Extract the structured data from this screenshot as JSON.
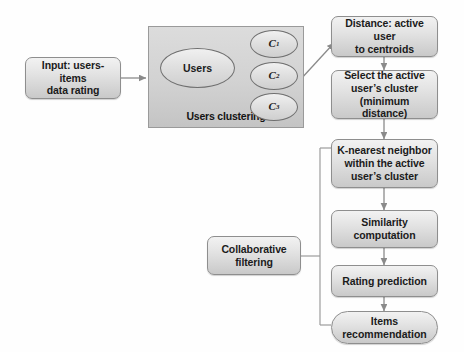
{
  "diagram": {
    "background_color": "#fefefe",
    "node_fill_light": "#f2f2f2",
    "node_fill_dark": "#c9c9c9",
    "node_border_color": "#8e8e8e",
    "group_fill": "#d4d4d4",
    "connector_color": "#8a8a8a"
  },
  "nodes": {
    "input": {
      "label_line1": "Input: users-items",
      "label_line2": "data rating",
      "shape": "rounded-rectangle"
    },
    "users": {
      "label": "Users",
      "shape": "ellipse"
    },
    "cluster1": {
      "label": "C",
      "subscript": "1",
      "shape": "ellipse"
    },
    "cluster2": {
      "label": "C",
      "subscript": "2",
      "shape": "ellipse"
    },
    "cluster3": {
      "label": "C",
      "subscript": "3",
      "shape": "ellipse"
    },
    "clustering_group": {
      "label": "Users clustering",
      "shape": "rectangle"
    },
    "distance": {
      "label_line1": "Distance: active user",
      "label_line2": "to centroids",
      "shape": "rounded-rectangle"
    },
    "select_cluster": {
      "label_line1": "Select the active",
      "label_line2": "user’s cluster",
      "label_line3": "(minimum distance)",
      "shape": "rounded-rectangle"
    },
    "knn": {
      "label_line1": "K-nearest neighbor",
      "label_line2": "within the active",
      "label_line3": "user’s cluster",
      "shape": "rounded-rectangle"
    },
    "similarity": {
      "label_line1": "Similarity",
      "label_line2": "computation",
      "shape": "rounded-rectangle"
    },
    "rating_prediction": {
      "label": "Rating prediction",
      "shape": "rounded-rectangle"
    },
    "items_recommendation": {
      "label_line1": "Items",
      "label_line2": "recommendation",
      "shape": "stadium"
    },
    "collaborative_filtering": {
      "label_line1": "Collaborative",
      "label_line2": "filtering",
      "shape": "rounded-rectangle"
    }
  },
  "connectors": [
    {
      "name": "input-to-clustering",
      "from": "input",
      "to": "clustering_group",
      "style": "arrow"
    },
    {
      "name": "users-to-cluster1",
      "from": "users",
      "to": "cluster1",
      "style": "arrow"
    },
    {
      "name": "users-to-cluster2",
      "from": "users",
      "to": "cluster2",
      "style": "arrow"
    },
    {
      "name": "users-to-cluster3",
      "from": "users",
      "to": "cluster3",
      "style": "arrow"
    },
    {
      "name": "clustering-to-distance",
      "from": "clustering_group",
      "to": "distance",
      "style": "arrow"
    },
    {
      "name": "distance-to-select",
      "from": "distance",
      "to": "select_cluster",
      "style": "arrow"
    },
    {
      "name": "select-to-knn",
      "from": "select_cluster",
      "to": "knn",
      "style": "arrow"
    },
    {
      "name": "knn-to-similarity",
      "from": "knn",
      "to": "similarity",
      "style": "arrow"
    },
    {
      "name": "similarity-to-rating",
      "from": "similarity",
      "to": "rating_prediction",
      "style": "arrow"
    },
    {
      "name": "rating-to-items",
      "from": "rating_prediction",
      "to": "items_recommendation",
      "style": "arrow"
    },
    {
      "name": "collaborative-filtering-bracket",
      "from": "collaborative_filtering",
      "to": "knn..items_recommendation",
      "style": "bracket"
    }
  ]
}
